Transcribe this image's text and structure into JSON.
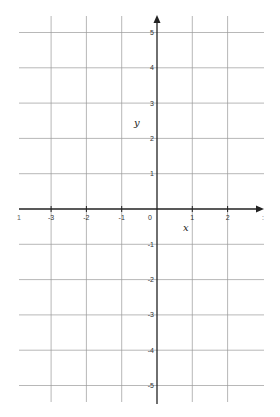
{
  "diagram": {
    "type": "coordinate-plane",
    "axis_labels": {
      "x": "x",
      "y": "y"
    },
    "x_ticks": [
      {
        "value": -4,
        "label": "-4",
        "partial": true
      },
      {
        "value": -3,
        "label": "-3"
      },
      {
        "value": -2,
        "label": "-2"
      },
      {
        "value": -1,
        "label": "-1"
      },
      {
        "value": 0,
        "label": "0"
      },
      {
        "value": 1,
        "label": "1"
      },
      {
        "value": 2,
        "label": "2"
      },
      {
        "value": 3,
        "label": "3",
        "partial": true
      }
    ],
    "y_ticks": [
      {
        "value": 5,
        "label": "5"
      },
      {
        "value": 4,
        "label": "4"
      },
      {
        "value": 3,
        "label": "3"
      },
      {
        "value": 2,
        "label": "2"
      },
      {
        "value": 1,
        "label": "1"
      },
      {
        "value": -1,
        "label": "-1"
      },
      {
        "value": -2,
        "label": "-2"
      },
      {
        "value": -3,
        "label": "-3"
      },
      {
        "value": -4,
        "label": "-4"
      },
      {
        "value": -5,
        "label": "-5"
      }
    ],
    "x_range": [
      -4,
      3
    ],
    "y_range": [
      -5.5,
      5.5
    ],
    "grid": true,
    "colors": {
      "grid": "#9a9a9a",
      "axis": "#222222",
      "text": "#333333"
    }
  }
}
